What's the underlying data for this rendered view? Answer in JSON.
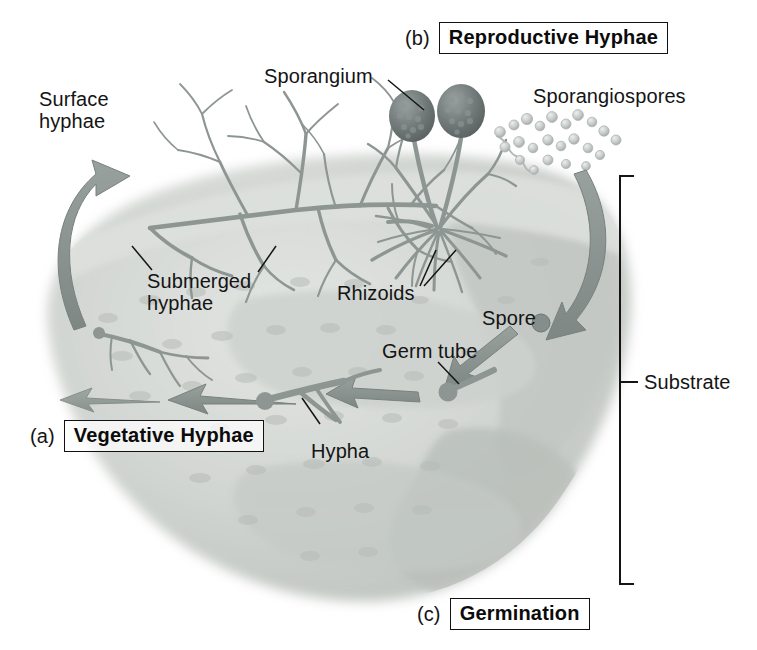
{
  "figure": {
    "title_alt": "Fungal growth and reproduction on a substrate",
    "background_color": "#ffffff",
    "ink_color": "#141414",
    "hypha_color": "#8f9894",
    "arrow_color": "#8a9491",
    "substrate_color": "#c9cdc9",
    "sporangium_color": "#6e7676"
  },
  "sections": [
    {
      "tag": "(a)",
      "label": "Vegetative Hyphae",
      "name": "vegetative-hyphae"
    },
    {
      "tag": "(b)",
      "label": "Reproductive Hyphae",
      "name": "reproductive-hyphae"
    },
    {
      "tag": "(c)",
      "label": "Germination",
      "name": "germination"
    }
  ],
  "labels": {
    "surface_hyphae": "Surface\nhyphae",
    "sporangium": "Sporangium",
    "sporangiospores": "Sporangiospores",
    "submerged_hyphae": "Submerged\nhyphae",
    "rhizoids": "Rhizoids",
    "spore": "Spore",
    "germ_tube": "Germ tube",
    "hypha": "Hypha",
    "substrate": "Substrate"
  },
  "structures": {
    "sporangia_count": 2,
    "spore_cloud_count": 23,
    "substrate_bracket": {
      "top": 175,
      "bottom": 585,
      "x": 622
    }
  }
}
